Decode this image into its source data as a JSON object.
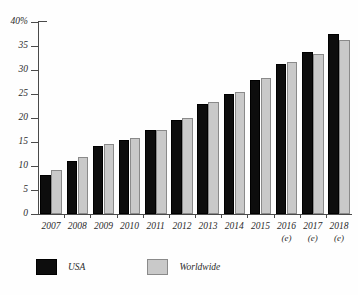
{
  "chart_data": {
    "type": "bar",
    "title": "",
    "xlabel": "",
    "ylabel": "",
    "ylim": [
      0,
      40
    ],
    "yticks": [
      0,
      5,
      10,
      15,
      20,
      25,
      30,
      35,
      40
    ],
    "ytick_labels": [
      "0",
      "5",
      "10",
      "15",
      "20",
      "25",
      "30",
      "35",
      "40%"
    ],
    "grid": false,
    "legend_position": "bottom-left",
    "categories": [
      "2007",
      "2008",
      "2009",
      "2010",
      "2011",
      "2012",
      "2013",
      "2014",
      "2015",
      "2016",
      "2017",
      "2018"
    ],
    "category_notes": [
      "",
      "",
      "",
      "",
      "",
      "",
      "",
      "",
      "",
      "(e)",
      "(e)",
      "(e)"
    ],
    "series": [
      {
        "name": "USA",
        "color": "#0d0d0d",
        "values": [
          8.2,
          11.0,
          14.1,
          15.5,
          17.5,
          19.5,
          23.0,
          25.0,
          28.0,
          31.3,
          33.8,
          37.5
        ]
      },
      {
        "name": "Worldwide",
        "color": "#c9c9c9",
        "values": [
          9.1,
          11.9,
          14.5,
          15.9,
          17.4,
          20.0,
          23.4,
          25.4,
          28.4,
          31.7,
          33.3,
          36.3
        ]
      }
    ]
  },
  "legend": {
    "items": [
      {
        "label": "USA",
        "swatch": "usa"
      },
      {
        "label": "Worldwide",
        "swatch": "worldwide"
      }
    ]
  }
}
